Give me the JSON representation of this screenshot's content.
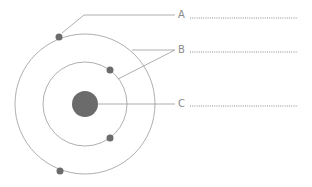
{
  "diagram": {
    "colors": {
      "line": "#9a9a9a",
      "particle": "#6b6b6b",
      "dots": "#8a8a8a"
    },
    "labels": [
      {
        "id": "A",
        "text": "A",
        "blank": "",
        "points_to": "electron"
      },
      {
        "id": "B",
        "text": "B",
        "blank": "",
        "points_to": "electron shells"
      },
      {
        "id": "C",
        "text": "C",
        "blank": "",
        "points_to": "nucleus"
      }
    ]
  }
}
